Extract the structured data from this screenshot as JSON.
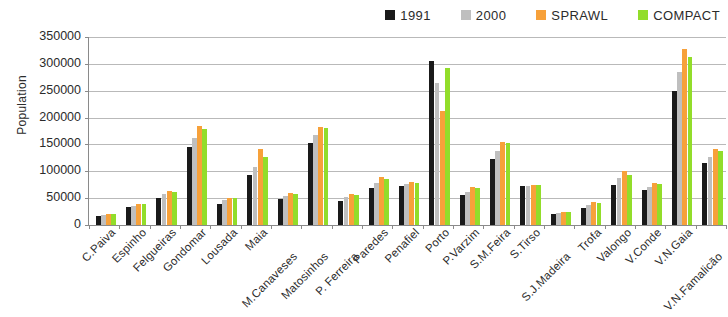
{
  "chart_data": {
    "type": "bar",
    "title": "",
    "xlabel": "",
    "ylabel": "Population",
    "ylim": [
      0,
      350000
    ],
    "ytick_values": [
      0,
      50000,
      100000,
      150000,
      200000,
      250000,
      300000,
      350000
    ],
    "ytick_labels": [
      "0",
      "50000",
      "100000",
      "150000",
      "200000",
      "250000",
      "300000",
      "350000"
    ],
    "grid": true,
    "legend_position": "top-right",
    "categories": [
      "C.Paiva",
      "Espinho",
      "Felgueiras",
      "Gondomar",
      "Lousada",
      "Maia",
      "M.Canaveses",
      "Matosinhos",
      "P. Ferreira",
      "Paredes",
      "Penafiel",
      "Porto",
      "P.Varzim",
      "S.M.Feira",
      "S.Tirso",
      "S.J.Madeira",
      "Trofa",
      "Valongo",
      "V.Conde",
      "V.N.Gaia",
      "V.N.Famalicão"
    ],
    "series": [
      {
        "name": "1991",
        "color": "#1a1a1a",
        "values": [
          17000,
          33000,
          51000,
          145000,
          40000,
          94000,
          49000,
          152000,
          45000,
          68000,
          72000,
          305000,
          55000,
          122000,
          72000,
          20000,
          32000,
          74000,
          65000,
          250000,
          115000
        ]
      },
      {
        "name": "2000",
        "color": "#bfbfbf",
        "values": [
          19000,
          36000,
          57000,
          162000,
          46000,
          108000,
          54000,
          168000,
          52000,
          78000,
          76000,
          265000,
          62000,
          138000,
          73000,
          22000,
          37000,
          88000,
          71000,
          285000,
          126000
        ]
      },
      {
        "name": "SPRAWL",
        "color": "#f7a13a",
        "values": [
          21000,
          40000,
          64000,
          185000,
          51000,
          142000,
          59000,
          183000,
          58000,
          89000,
          81000,
          212000,
          71000,
          155000,
          75000,
          25000,
          43000,
          100000,
          79000,
          328000,
          142000
        ]
      },
      {
        "name": "COMPACT",
        "color": "#92dd2a",
        "values": [
          20000,
          39000,
          61000,
          178000,
          50000,
          127000,
          58000,
          181000,
          56000,
          85000,
          79000,
          292000,
          68000,
          152000,
          75000,
          24000,
          41000,
          94000,
          77000,
          312000,
          138000
        ]
      }
    ]
  }
}
